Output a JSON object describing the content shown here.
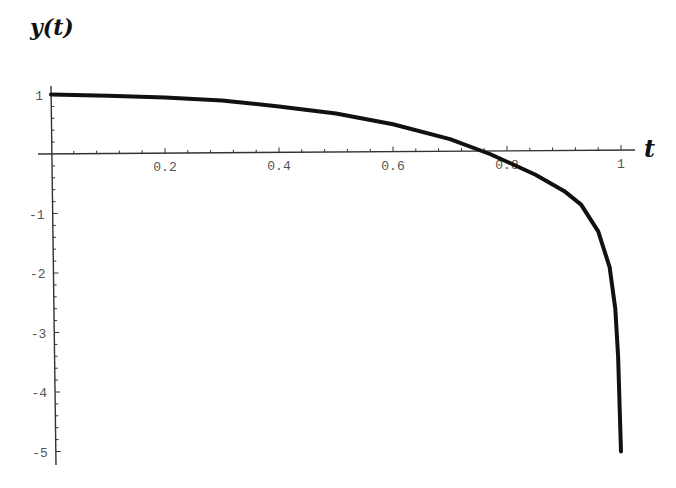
{
  "chart_data": {
    "type": "line",
    "title": "",
    "xlabel": "t",
    "ylabel": "y(t)",
    "xlim": [
      0,
      1
    ],
    "ylim": [
      -5,
      1
    ],
    "grid": false,
    "legend": null,
    "x_ticks": [
      "0.2",
      "0.4",
      "0.6",
      "0.8",
      "1"
    ],
    "y_ticks": [
      "1",
      "-1",
      "-2",
      "-3",
      "-4",
      "-5"
    ],
    "series": [
      {
        "name": "y(t)",
        "color": "#111111",
        "x": [
          0.0,
          0.1,
          0.2,
          0.3,
          0.4,
          0.5,
          0.6,
          0.7,
          0.77,
          0.8,
          0.85,
          0.9,
          0.93,
          0.96,
          0.98,
          0.99,
          0.995,
          1.0
        ],
        "y": [
          1.0,
          0.98,
          0.95,
          0.9,
          0.8,
          0.68,
          0.5,
          0.25,
          0.0,
          -0.13,
          -0.35,
          -0.62,
          -0.85,
          -1.3,
          -1.9,
          -2.6,
          -3.4,
          -5.0
        ]
      }
    ]
  }
}
